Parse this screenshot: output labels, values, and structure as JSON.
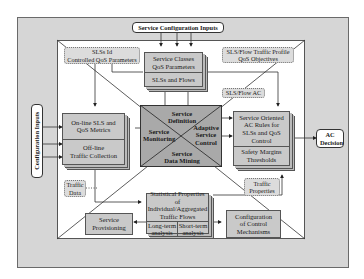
{
  "inputs": {
    "service_configuration": "Service Configuration Inputs",
    "configuration": "Configuration Inputs"
  },
  "output": {
    "ac_decision": "AC Decision"
  },
  "top": {
    "slss_controlled_qos": [
      "SLSs Id",
      "Controlled QoS Parameters"
    ],
    "service_classes": [
      "Service Classes",
      "QoS Parameters"
    ],
    "slss_and_flows": "SLSs and Flows",
    "traffic_profile": [
      "SLS/Flow Traffic Profile",
      "QoS Objectives"
    ],
    "sls_flow_ac": "SLS/Flow AC"
  },
  "left": {
    "online": [
      "On-line SLS and",
      "QoS Metrics"
    ],
    "offline": [
      "Off-line",
      "Traffic Collection"
    ],
    "traffic_data": [
      "Traffic",
      "Data"
    ]
  },
  "center": {
    "top": [
      "Service",
      "Definition"
    ],
    "left": [
      "Service",
      "Monitoring"
    ],
    "right": [
      "Adaptive",
      "Service",
      "Control"
    ],
    "bottom": [
      "Service",
      "Data Mining"
    ]
  },
  "right": {
    "ac_rules": [
      "Service Oriented",
      "AC Rules for",
      "SLSs and QoS",
      "Control"
    ],
    "safety": [
      "Safety Margins",
      "Thresholds"
    ],
    "traffic_properties": [
      "Traffic",
      "Properties"
    ]
  },
  "bottom": {
    "statistical": [
      "Statistical Properties of",
      "Individual/Aggregated",
      "Traffic Flows"
    ],
    "long_term": [
      "Long-term",
      "analysis"
    ],
    "short_term": [
      "Short-term",
      "analysis"
    ],
    "provisioning": [
      "Service",
      "Provisioning"
    ],
    "config_control": [
      "Configuration",
      "of Control",
      "Mechanisms"
    ]
  }
}
